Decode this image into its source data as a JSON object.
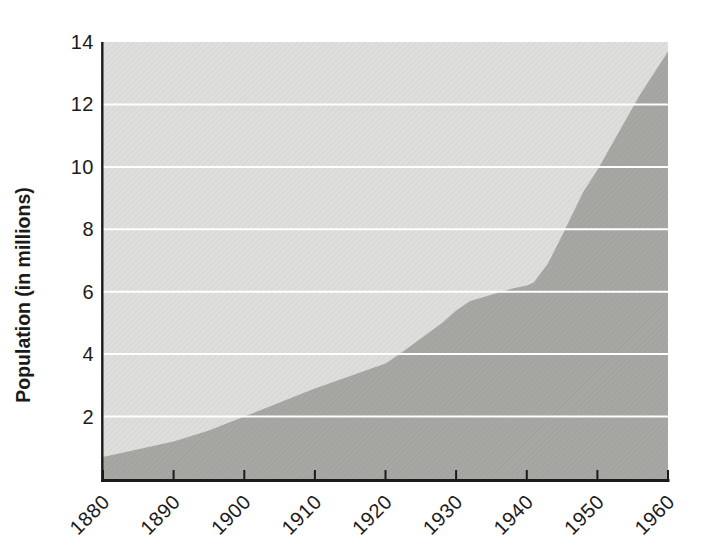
{
  "chart_data": {
    "type": "area",
    "title": "",
    "subtitle": "",
    "xlabel": "",
    "ylabel": "Population (in millions)",
    "xlim": [
      1880,
      1960
    ],
    "ylim": [
      0,
      14
    ],
    "yticks": [
      2,
      4,
      6,
      8,
      10,
      12,
      14
    ],
    "xticks": [
      1880,
      1890,
      1900,
      1910,
      1920,
      1930,
      1940,
      1950,
      1960
    ],
    "grid": "horizontal white gridlines at even values, drawn over both fills",
    "legend": "none",
    "series": [
      {
        "name": "Population",
        "points": [
          [
            1880,
            0.7
          ],
          [
            1885,
            0.95
          ],
          [
            1890,
            1.2
          ],
          [
            1895,
            1.55
          ],
          [
            1900,
            2.0
          ],
          [
            1905,
            2.45
          ],
          [
            1910,
            2.9
          ],
          [
            1915,
            3.3
          ],
          [
            1920,
            3.7
          ],
          [
            1922,
            4.0
          ],
          [
            1925,
            4.5
          ],
          [
            1928,
            5.0
          ],
          [
            1930,
            5.4
          ],
          [
            1932,
            5.7
          ],
          [
            1935,
            5.9
          ],
          [
            1938,
            6.1
          ],
          [
            1940,
            6.2
          ],
          [
            1941,
            6.3
          ],
          [
            1943,
            6.9
          ],
          [
            1945,
            7.8
          ],
          [
            1948,
            9.2
          ],
          [
            1950,
            9.9
          ],
          [
            1953,
            11.1
          ],
          [
            1956,
            12.3
          ],
          [
            1958,
            13.0
          ],
          [
            1960,
            13.7
          ]
        ]
      }
    ],
    "values_by_decade": {
      "1880": 0.7,
      "1890": 1.2,
      "1900": 2.0,
      "1910": 2.9,
      "1920": 3.7,
      "1930": 5.4,
      "1940": 6.2,
      "1950": 9.9,
      "1960": 13.7
    },
    "colors": {
      "page_background": "#ffffff",
      "plot_background": "#dedfdc",
      "area_fill": "#a7a8a4",
      "gridline": "#ffffff",
      "axis": "#1b1b1b",
      "tick_label": "#1b1b1b"
    }
  }
}
